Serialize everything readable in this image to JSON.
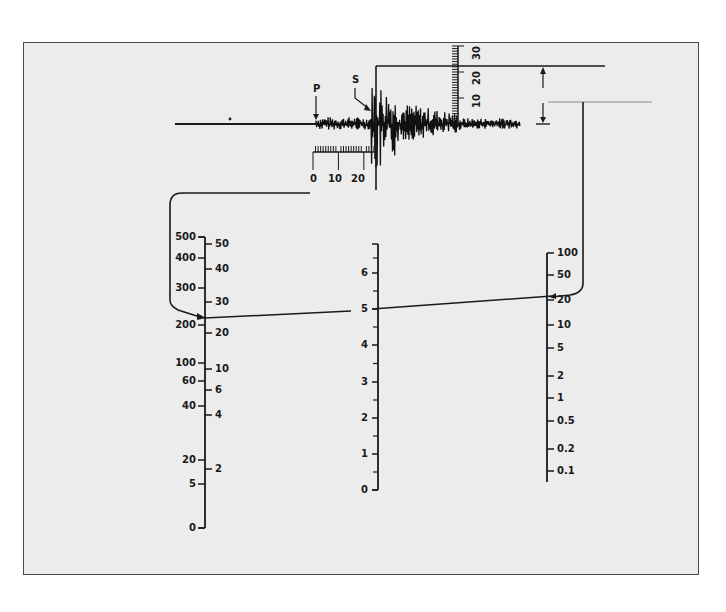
{
  "figure": {
    "frame_bg": "#ececec",
    "ink": "#1a1a1a"
  },
  "seismogram": {
    "p_label": "P",
    "s_label": "S",
    "time_scale": {
      "labels": [
        "0",
        "10",
        "20"
      ],
      "unit": "s",
      "s_minus_p": 24
    },
    "amplitude_scale": {
      "labels": [
        "10",
        "20",
        "30"
      ],
      "unit": "mm",
      "max_amplitude": 23
    }
  },
  "left_scale": {
    "left_labels": [
      {
        "v": "500",
        "y": 237
      },
      {
        "v": "400",
        "y": 258
      },
      {
        "v": "300",
        "y": 288
      },
      {
        "v": "200",
        "y": 325
      },
      {
        "v": "100",
        "y": 363
      },
      {
        "v": "60",
        "y": 381
      },
      {
        "v": "40",
        "y": 406
      },
      {
        "v": "20",
        "y": 460
      },
      {
        "v": "5",
        "y": 484
      },
      {
        "v": "0",
        "y": 528
      }
    ],
    "right_labels": [
      {
        "v": "50",
        "y": 244
      },
      {
        "v": "40",
        "y": 269
      },
      {
        "v": "30",
        "y": 302
      },
      {
        "v": "20",
        "y": 333
      },
      {
        "v": "10",
        "y": 369
      },
      {
        "v": "6",
        "y": 390
      },
      {
        "v": "4",
        "y": 415
      },
      {
        "v": "2",
        "y": 469
      }
    ],
    "left_meaning": "Distance (km)",
    "right_meaning": "S-P time (s)",
    "reading": 24
  },
  "middle_scale": {
    "labels": [
      {
        "v": "6",
        "y": 273
      },
      {
        "v": "5",
        "y": 309
      },
      {
        "v": "4",
        "y": 345
      },
      {
        "v": "3",
        "y": 382
      },
      {
        "v": "2",
        "y": 418
      },
      {
        "v": "1",
        "y": 454
      },
      {
        "v": "0",
        "y": 490
      }
    ],
    "meaning": "Magnitude",
    "reading": 5
  },
  "right_scale": {
    "labels": [
      {
        "v": "100",
        "y": 253
      },
      {
        "v": "50",
        "y": 275
      },
      {
        "v": "20",
        "y": 300
      },
      {
        "v": "10",
        "y": 325
      },
      {
        "v": "5",
        "y": 348
      },
      {
        "v": "2",
        "y": 376
      },
      {
        "v": "1",
        "y": 398
      },
      {
        "v": "0.5",
        "y": 421
      },
      {
        "v": "0.2",
        "y": 449
      },
      {
        "v": "0.1",
        "y": 471
      }
    ],
    "meaning": "Amplitude (mm)",
    "reading": 23
  },
  "labels": {
    "p": "P",
    "s": "S",
    "t0": "0",
    "t10": "10",
    "t20": "20",
    "a10": "10",
    "a20": "20",
    "a30": "30"
  }
}
